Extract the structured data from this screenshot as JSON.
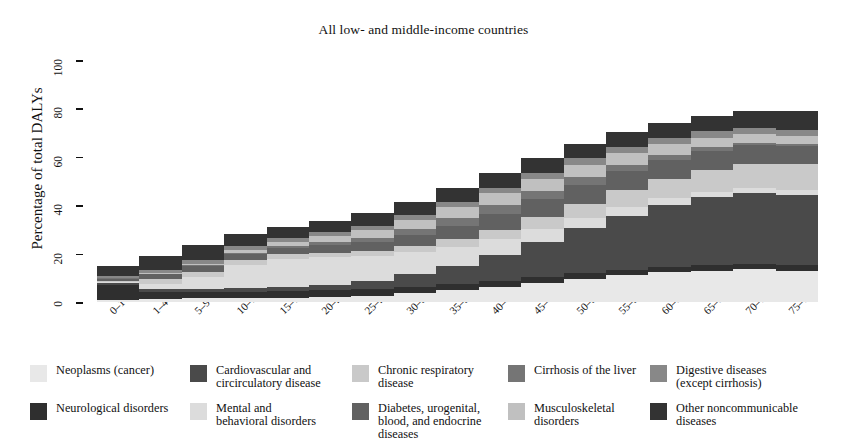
{
  "chart_data": {
    "type": "area",
    "title": "All low- and middle-income countries",
    "xlabel": "",
    "ylabel": "Percentage of total DALYs",
    "ylim": [
      0,
      100
    ],
    "yticks": [
      0,
      20,
      40,
      60,
      80,
      100
    ],
    "grid": false,
    "legend_position": "bottom",
    "stacked": true,
    "categories": [
      "0–1",
      "1–4",
      "5–9",
      "10–14",
      "15–19",
      "20–24",
      "25–29",
      "30–34",
      "35–39",
      "40–44",
      "45–49",
      "50–54",
      "55–59",
      "60–64",
      "65–69",
      "70–74",
      "75–79"
    ],
    "series": [
      {
        "name": "Neoplasms (cancer)",
        "color": "#e8e8e8",
        "values": [
          0.7,
          1.2,
          1.6,
          1.6,
          1.7,
          2.0,
          2.6,
          3.6,
          4.8,
          6.2,
          7.7,
          9.5,
          11.0,
          12.2,
          13.0,
          13.5,
          13.0
        ]
      },
      {
        "name": "Neurological disorders",
        "color": "#2f2f2f",
        "values": [
          6.4,
          3.0,
          2.4,
          2.6,
          2.8,
          2.8,
          2.8,
          2.7,
          2.6,
          2.6,
          2.5,
          2.4,
          2.3,
          2.2,
          2.2,
          2.2,
          2.3
        ]
      },
      {
        "name": "Cardiovascular and circirculatory disease",
        "color": "#4a4a4a",
        "values": [
          0.8,
          1.0,
          1.2,
          1.5,
          1.8,
          2.4,
          3.4,
          5.2,
          7.6,
          10.6,
          14.5,
          18.6,
          22.4,
          25.6,
          28.0,
          29.4,
          29.0
        ]
      },
      {
        "name": "Mental and behavioral disorders",
        "color": "#dcdcdc",
        "values": [
          0.3,
          2.4,
          5.0,
          9.5,
          11.5,
          11.2,
          10.2,
          9.0,
          7.8,
          6.5,
          5.3,
          4.2,
          3.4,
          2.8,
          2.4,
          2.1,
          1.8
        ]
      },
      {
        "name": "Chronic respiratory disease",
        "color": "#c9c9c9",
        "values": [
          0.5,
          1.8,
          2.2,
          2.0,
          1.9,
          2.0,
          2.2,
          2.6,
          3.2,
          4.0,
          5.0,
          6.0,
          7.0,
          8.0,
          9.0,
          10.0,
          11.0
        ]
      },
      {
        "name": "Diabetes, urogenital, blood, and endocrine diseases",
        "color": "#616161",
        "values": [
          1.0,
          2.0,
          2.4,
          2.6,
          2.8,
          3.2,
          3.8,
          4.6,
          5.6,
          6.6,
          7.4,
          7.8,
          8.0,
          8.0,
          7.8,
          7.6,
          7.4
        ]
      },
      {
        "name": "Cirrhosis of the liver",
        "color": "#757575",
        "values": [
          0.2,
          0.3,
          0.3,
          0.3,
          0.5,
          1.0,
          1.6,
          2.4,
          3.2,
          3.6,
          3.6,
          3.2,
          2.6,
          2.0,
          1.5,
          1.1,
          0.8
        ]
      },
      {
        "name": "Musculoskeletal disorders",
        "color": "#c0c0c0",
        "values": [
          0.1,
          0.3,
          0.7,
          1.4,
          2.0,
          2.6,
          3.2,
          3.8,
          4.4,
          4.8,
          5.0,
          5.0,
          4.8,
          4.4,
          4.0,
          3.6,
          3.2
        ]
      },
      {
        "name": "Digestive diseases (except cirrhosis)",
        "color": "#888888",
        "values": [
          0.8,
          1.4,
          1.6,
          1.6,
          1.6,
          1.7,
          1.8,
          2.0,
          2.2,
          2.4,
          2.5,
          2.6,
          2.6,
          2.6,
          2.6,
          2.6,
          2.6
        ]
      },
      {
        "name": "Other noncommunicable diseases",
        "color": "#333333",
        "values": [
          4.2,
          5.6,
          6.0,
          5.0,
          4.4,
          4.6,
          5.0,
          5.4,
          5.8,
          6.0,
          6.0,
          6.0,
          6.0,
          6.2,
          6.5,
          7.0,
          8.0
        ]
      }
    ],
    "stack_order_bottom_to_top": [
      "Neoplasms (cancer)",
      "Neurological disorders",
      "Cardiovascular and circirculatory disease",
      "Mental and behavioral disorders",
      "Chronic respiratory disease",
      "Diabetes, urogenital, blood, and endocrine diseases",
      "Cirrhosis of the liver",
      "Musculoskeletal disorders",
      "Digestive diseases (except cirrhosis)",
      "Other noncommunicable diseases"
    ],
    "totals": [
      15.0,
      19.0,
      23.4,
      28.1,
      31.0,
      33.5,
      36.6,
      41.3,
      47.2,
      53.3,
      59.5,
      65.3,
      70.1,
      74.0,
      77.0,
      79.1,
      81.1
    ]
  },
  "legend": {
    "items": [
      {
        "label": "Neoplasms (cancer)",
        "color": "#e8e8e8",
        "icon": "legend-swatch"
      },
      {
        "label": "Cardiovascular and\ncircirculatory disease",
        "color": "#4a4a4a",
        "icon": "legend-swatch"
      },
      {
        "label": "Chronic respiratory\ndisease",
        "color": "#c9c9c9",
        "icon": "legend-swatch"
      },
      {
        "label": "Cirrhosis of the liver",
        "color": "#757575",
        "icon": "legend-swatch"
      },
      {
        "label": "Digestive diseases\n(except cirrhosis)",
        "color": "#888888",
        "icon": "legend-swatch"
      },
      {
        "label": "Neurological disorders",
        "color": "#2f2f2f",
        "icon": "legend-swatch"
      },
      {
        "label": "Mental and\nbehavioral disorders",
        "color": "#dcdcdc",
        "icon": "legend-swatch"
      },
      {
        "label": "Diabetes, urogenital,\nblood, and endocrine\ndiseases",
        "color": "#616161",
        "icon": "legend-swatch"
      },
      {
        "label": "Musculoskeletal\ndisorders",
        "color": "#c0c0c0",
        "icon": "legend-swatch"
      },
      {
        "label": "Other noncommunicable\ndiseases",
        "color": "#333333",
        "icon": "legend-swatch"
      }
    ]
  },
  "colors": {
    "background": "#ffffff",
    "axis": "#111111",
    "text": "#111111"
  }
}
